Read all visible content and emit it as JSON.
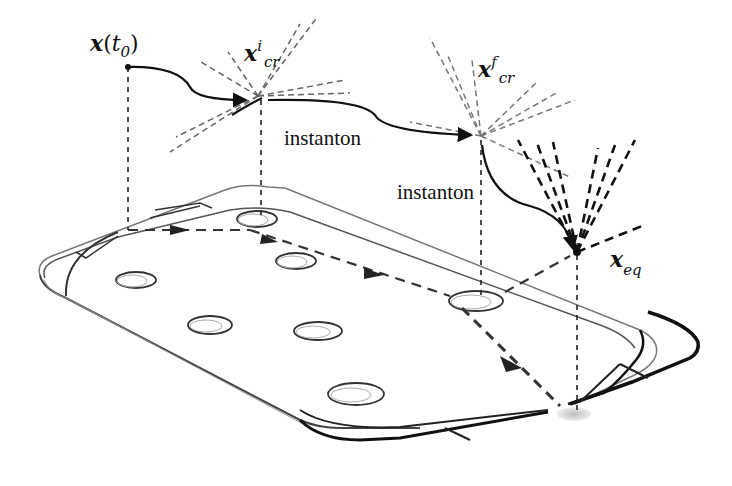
{
  "figure": {
    "labels": {
      "x_t0": {
        "main": "x",
        "paren_open": "(",
        "t": "t",
        "sub": "0",
        "paren_close": ")"
      },
      "x_cr_i": {
        "main": "x",
        "sup": "i",
        "sub": "cr"
      },
      "x_cr_f": {
        "main": "x",
        "sup": "f",
        "sub": "cr"
      },
      "x_eq": {
        "main": "x",
        "sub": "eq"
      },
      "instanton_1": "instanton",
      "instanton_2": "instanton"
    },
    "colors": {
      "line": "#111111",
      "dash_light": "#777777",
      "plate_edge": "#555555",
      "shadow": "#cfcfcf"
    }
  }
}
